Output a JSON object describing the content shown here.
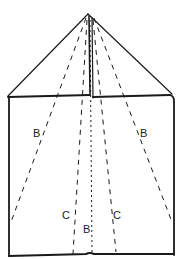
{
  "diagram": {
    "colors": {
      "stroke": "#1a1a1a",
      "background": "#ffffff"
    },
    "labels": {
      "b_left": "B",
      "b_right": "B",
      "c_left": "C",
      "c_right": "C",
      "b_center": "B"
    }
  }
}
